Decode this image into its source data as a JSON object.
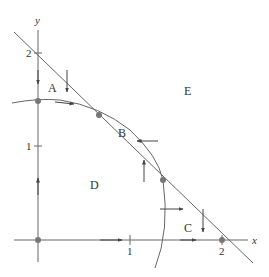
{
  "diagram": {
    "type": "phase-plane",
    "axes": {
      "x_label": "x",
      "y_label": "y",
      "x_ticks": [
        "1",
        "2"
      ],
      "y_ticks": [
        "1",
        "2"
      ]
    },
    "regions": [
      {
        "id": "A",
        "label": "A"
      },
      {
        "id": "B",
        "label": "B"
      },
      {
        "id": "C",
        "label": "C"
      },
      {
        "id": "D",
        "label": "D"
      },
      {
        "id": "E",
        "label": "E"
      }
    ],
    "curves": [
      {
        "name": "straight-nullcline",
        "description": "line x + y = 2"
      },
      {
        "name": "curved-nullcline",
        "description": "ellipse arc from y-axis to x-axis"
      }
    ],
    "equilibria": [
      {
        "name": "origin",
        "x": 0,
        "y": 0
      },
      {
        "name": "y-axis-point",
        "x": 0,
        "y": 1.5
      },
      {
        "name": "upper-intersection",
        "x": 0.65,
        "y": 1.35
      },
      {
        "name": "lower-intersection",
        "x": 1.37,
        "y": 0.65
      },
      {
        "name": "x-axis-point",
        "x": 2,
        "y": 0
      }
    ],
    "colors": {
      "line": "#555555",
      "point": "#666666",
      "text": "#333333"
    }
  }
}
